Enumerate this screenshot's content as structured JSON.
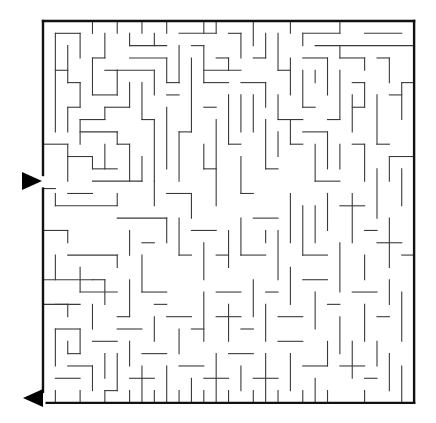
{
  "puzzle": {
    "type": "maze",
    "colors": {
      "wall": "#3a3a3a",
      "border": "#111111",
      "arrow": "#000000",
      "background": "#ffffff"
    },
    "grid": {
      "origin_x": 43,
      "origin_y": 21,
      "cell_w": 12.37,
      "cell_h": 12.32,
      "cols": 30,
      "rows": 31
    },
    "entrance": {
      "side": "left",
      "arrow": "right-pointing",
      "y": 181,
      "gap_rows": [
        12.5,
        13.6
      ]
    },
    "exit": {
      "side": "left-bottom",
      "arrow": "left-pointing",
      "y": 398,
      "gap_rows": [
        30.1,
        31
      ]
    },
    "border": [
      [
        0,
        0,
        30,
        0
      ],
      [
        30,
        0,
        30,
        31
      ],
      [
        30,
        31,
        0.3,
        31
      ],
      [
        0,
        30.1,
        0,
        13.6
      ],
      [
        0,
        12.5,
        0,
        0
      ]
    ],
    "walls": [
      [
        4,
        0,
        4,
        1
      ],
      [
        6,
        0,
        6,
        1
      ],
      [
        8,
        0,
        8,
        1
      ],
      [
        10,
        0,
        10,
        1
      ],
      [
        13,
        0,
        13,
        1
      ],
      [
        17,
        0,
        17,
        2
      ],
      [
        20,
        0,
        20,
        1
      ],
      [
        24,
        0,
        24,
        1
      ],
      [
        1,
        1,
        3,
        1
      ],
      [
        3,
        1,
        3,
        3
      ],
      [
        5,
        1,
        5,
        3
      ],
      [
        5,
        3,
        4,
        3
      ],
      [
        7,
        1,
        7,
        2
      ],
      [
        7,
        2,
        10,
        2
      ],
      [
        9,
        2,
        9,
        1
      ],
      [
        11,
        1,
        14,
        1
      ],
      [
        14,
        1,
        14,
        0
      ],
      [
        15,
        1,
        16,
        1
      ],
      [
        16,
        1,
        16,
        3
      ],
      [
        18,
        1,
        18,
        3
      ],
      [
        19,
        1,
        19,
        4
      ],
      [
        21,
        1,
        24,
        1
      ],
      [
        21,
        1,
        21,
        2
      ],
      [
        22,
        2,
        30,
        2
      ],
      [
        26,
        1,
        29,
        1
      ],
      [
        1,
        1,
        1,
        9
      ],
      [
        2,
        2,
        2,
        5
      ],
      [
        2,
        5,
        3,
        5
      ],
      [
        3,
        5,
        3,
        7
      ],
      [
        3,
        7,
        2,
        7
      ],
      [
        2,
        7,
        2,
        9
      ],
      [
        1,
        4,
        2,
        4
      ],
      [
        4,
        3,
        4,
        6
      ],
      [
        4,
        6,
        6,
        6
      ],
      [
        6,
        6,
        6,
        4
      ],
      [
        6,
        4,
        9,
        4
      ],
      [
        9,
        4,
        9,
        6
      ],
      [
        5,
        4,
        6,
        4
      ],
      [
        7,
        3,
        10,
        3
      ],
      [
        10,
        3,
        10,
        5
      ],
      [
        10,
        5,
        11,
        5
      ],
      [
        8,
        5,
        8,
        8
      ],
      [
        8,
        8,
        9,
        8
      ],
      [
        9,
        8,
        9,
        13
      ],
      [
        7,
        5,
        7,
        7
      ],
      [
        7,
        7,
        5,
        7
      ],
      [
        5,
        7,
        5,
        8
      ],
      [
        5,
        8,
        3,
        8
      ],
      [
        3,
        8,
        3,
        10
      ],
      [
        11,
        2,
        11,
        5
      ],
      [
        12,
        2,
        13,
        2
      ],
      [
        13,
        2,
        13,
        5
      ],
      [
        13,
        5,
        15,
        5
      ],
      [
        12,
        3,
        12,
        9
      ],
      [
        12,
        9,
        11,
        9
      ],
      [
        11,
        9,
        11,
        13
      ],
      [
        14,
        3,
        15,
        3
      ],
      [
        15,
        3,
        15,
        4
      ],
      [
        16,
        4,
        13,
        4
      ],
      [
        17,
        3,
        18,
        3
      ],
      [
        19,
        4,
        20,
        4
      ],
      [
        20,
        3,
        20,
        6
      ],
      [
        21,
        3,
        23,
        3
      ],
      [
        23,
        3,
        23,
        6
      ],
      [
        24,
        3,
        26,
        3
      ],
      [
        24,
        2,
        24,
        3
      ],
      [
        26,
        3,
        26,
        4
      ],
      [
        27,
        3,
        28,
        3
      ],
      [
        28,
        3,
        28,
        5
      ],
      [
        29,
        5,
        30,
        5
      ],
      [
        29,
        5,
        29,
        8
      ],
      [
        16,
        5,
        18,
        5
      ],
      [
        18,
        5,
        18,
        7
      ],
      [
        17,
        6,
        17,
        9
      ],
      [
        21,
        4,
        21,
        7
      ],
      [
        21,
        7,
        22,
        7
      ],
      [
        22,
        5,
        22,
        4
      ],
      [
        24,
        4,
        24,
        8
      ],
      [
        24,
        8,
        23,
        8
      ],
      [
        25,
        5,
        26,
        5
      ],
      [
        26,
        5,
        26,
        7
      ],
      [
        26,
        7,
        25,
        7
      ],
      [
        25,
        6,
        25,
        9
      ],
      [
        27,
        6,
        27,
        10
      ],
      [
        27,
        10,
        28,
        10
      ],
      [
        28,
        6,
        29,
        6
      ],
      [
        0,
        10,
        2,
        10
      ],
      [
        2,
        10,
        2,
        13
      ],
      [
        2,
        11,
        4,
        11
      ],
      [
        4,
        11,
        4,
        12
      ],
      [
        4,
        12,
        6,
        12
      ],
      [
        5,
        10,
        5,
        12
      ],
      [
        6,
        10,
        7,
        10
      ],
      [
        7,
        10,
        7,
        13
      ],
      [
        3,
        9,
        6,
        9
      ],
      [
        6,
        9,
        6,
        10
      ],
      [
        4,
        13,
        8,
        13
      ],
      [
        8,
        11,
        8,
        13
      ],
      [
        0,
        13.6,
        1,
        13.6
      ],
      [
        1,
        14,
        1,
        15
      ],
      [
        1,
        15,
        6,
        15
      ],
      [
        6,
        15,
        6,
        14
      ],
      [
        2,
        14,
        4,
        14
      ],
      [
        9,
        13,
        9,
        15
      ],
      [
        10,
        14,
        12,
        14
      ],
      [
        12,
        14,
        12,
        16
      ],
      [
        13,
        10,
        13,
        12
      ],
      [
        13,
        12,
        14,
        12
      ],
      [
        14,
        8,
        14,
        15
      ],
      [
        15,
        6,
        15,
        10
      ],
      [
        15,
        10,
        16,
        10
      ],
      [
        16,
        11,
        16,
        14
      ],
      [
        16,
        14,
        17,
        14
      ],
      [
        18,
        8,
        18,
        12
      ],
      [
        18,
        12,
        19,
        12
      ],
      [
        19,
        9,
        19,
        11
      ],
      [
        20,
        8,
        20,
        10
      ],
      [
        20,
        10,
        21,
        10
      ],
      [
        21,
        9,
        23,
        9
      ],
      [
        23,
        9,
        23,
        12
      ],
      [
        22,
        10,
        22,
        13
      ],
      [
        22,
        13,
        24,
        13
      ],
      [
        24,
        10,
        24,
        12
      ],
      [
        25,
        10,
        26,
        10
      ],
      [
        26,
        10,
        26,
        13
      ],
      [
        28,
        11,
        30,
        11
      ],
      [
        28,
        11,
        28,
        13
      ],
      [
        29,
        12,
        29,
        15
      ],
      [
        27,
        12,
        27,
        16
      ],
      [
        10,
        6,
        11,
        6
      ],
      [
        10,
        7,
        10,
        12
      ],
      [
        14,
        7,
        13,
        7
      ],
      [
        16,
        6,
        16,
        9
      ],
      [
        19,
        6,
        19,
        8
      ],
      [
        19,
        8,
        21,
        8
      ],
      [
        0,
        17,
        2,
        17
      ],
      [
        2,
        17,
        2,
        18
      ],
      [
        1,
        19,
        1,
        21
      ],
      [
        2,
        19,
        6,
        19
      ],
      [
        6,
        19,
        6,
        20
      ],
      [
        3,
        20,
        3,
        22
      ],
      [
        4,
        21,
        5,
        21
      ],
      [
        5,
        21,
        5,
        23
      ],
      [
        0,
        21,
        4,
        21
      ],
      [
        1,
        23,
        2,
        23
      ],
      [
        2,
        23,
        2,
        24
      ],
      [
        1,
        25,
        1,
        28
      ],
      [
        1,
        25,
        3,
        25
      ],
      [
        3,
        25,
        3,
        27
      ],
      [
        3,
        27,
        2,
        27
      ],
      [
        2,
        26,
        2,
        27
      ],
      [
        3,
        22,
        6,
        22
      ],
      [
        4,
        23,
        4,
        25
      ],
      [
        6,
        24,
        7,
        24
      ],
      [
        7,
        21,
        7,
        24
      ],
      [
        8,
        19,
        8,
        22
      ],
      [
        8,
        22,
        10,
        22
      ],
      [
        9,
        23,
        10,
        23
      ],
      [
        6,
        16,
        10,
        16
      ],
      [
        10,
        16,
        10,
        18
      ],
      [
        7,
        17,
        7,
        19
      ],
      [
        8,
        18,
        9,
        18
      ],
      [
        11,
        16,
        11,
        19
      ],
      [
        11,
        19,
        12,
        19
      ],
      [
        12,
        17,
        14,
        17
      ],
      [
        13,
        18,
        13,
        21
      ],
      [
        14,
        19,
        15,
        19
      ],
      [
        15,
        17,
        15,
        20
      ],
      [
        16,
        16,
        16,
        19
      ],
      [
        16,
        19,
        18,
        19
      ],
      [
        17,
        16,
        19,
        16
      ],
      [
        18,
        17,
        18,
        18
      ],
      [
        19,
        17,
        19,
        21
      ],
      [
        20,
        14,
        20,
        18
      ],
      [
        21,
        15,
        21,
        19
      ],
      [
        21,
        19,
        23,
        19
      ],
      [
        22,
        15,
        22,
        18
      ],
      [
        23,
        14,
        23,
        17
      ],
      [
        24,
        15,
        26,
        15
      ],
      [
        25,
        14,
        25,
        18
      ],
      [
        26,
        17,
        27,
        17
      ],
      [
        27,
        18,
        29,
        18
      ],
      [
        28,
        16,
        28,
        20
      ],
      [
        29,
        19,
        30,
        19
      ],
      [
        26,
        19,
        26,
        21
      ],
      [
        24,
        18,
        24,
        22
      ],
      [
        0,
        23,
        3,
        23
      ],
      [
        4,
        26,
        6,
        26
      ],
      [
        5,
        27,
        5,
        29
      ],
      [
        6,
        25,
        8,
        25
      ],
      [
        7,
        26,
        7,
        28
      ],
      [
        8,
        27,
        10,
        27
      ],
      [
        9,
        24,
        9,
        26
      ],
      [
        10,
        24,
        12,
        24
      ],
      [
        11,
        25,
        11,
        27
      ],
      [
        12,
        25,
        13,
        25
      ],
      [
        13,
        22,
        13,
        26
      ],
      [
        14,
        22,
        16,
        22
      ],
      [
        15,
        23,
        15,
        26
      ],
      [
        14,
        24,
        16,
        24
      ],
      [
        16,
        25,
        17,
        25
      ],
      [
        17,
        21,
        17,
        24
      ],
      [
        18,
        22,
        19,
        22
      ],
      [
        18,
        23,
        18,
        26
      ],
      [
        19,
        24,
        21,
        24
      ],
      [
        20,
        20,
        20,
        23
      ],
      [
        21,
        21,
        23,
        21
      ],
      [
        22,
        22,
        22,
        25
      ],
      [
        23,
        23,
        24,
        23
      ],
      [
        24,
        24,
        24,
        27
      ],
      [
        25,
        22,
        27,
        22
      ],
      [
        26,
        23,
        26,
        26
      ],
      [
        27,
        24,
        28,
        24
      ],
      [
        28,
        21,
        28,
        23
      ],
      [
        29,
        22,
        29,
        26
      ],
      [
        1,
        29,
        3,
        29
      ],
      [
        2,
        28,
        4,
        28
      ],
      [
        4,
        28,
        4,
        30
      ],
      [
        5,
        30,
        6,
        30
      ],
      [
        6,
        27,
        6,
        30
      ],
      [
        7,
        29,
        9,
        29
      ],
      [
        8,
        28,
        8,
        31
      ],
      [
        10,
        28,
        10,
        31
      ],
      [
        11,
        28,
        13,
        28
      ],
      [
        12,
        29,
        12,
        31
      ],
      [
        13,
        29,
        15,
        29
      ],
      [
        14,
        27,
        14,
        31
      ],
      [
        15,
        27,
        17,
        27
      ],
      [
        16,
        28,
        16,
        30
      ],
      [
        17,
        29,
        19,
        29
      ],
      [
        18,
        27,
        18,
        31
      ],
      [
        19,
        26,
        21,
        26
      ],
      [
        20,
        27,
        20,
        30
      ],
      [
        21,
        28,
        23,
        28
      ],
      [
        22,
        29,
        22,
        31
      ],
      [
        23,
        26,
        23,
        28
      ],
      [
        24,
        28,
        26,
        28
      ],
      [
        25,
        26,
        25,
        29
      ],
      [
        26,
        29,
        27,
        29
      ],
      [
        27,
        26,
        27,
        28
      ],
      [
        28,
        27,
        28,
        30
      ],
      [
        29,
        28,
        29,
        31
      ],
      [
        1,
        30,
        1,
        31
      ],
      [
        3,
        30,
        3,
        31
      ],
      [
        5,
        31,
        5,
        30
      ],
      [
        7,
        30,
        7,
        31
      ],
      [
        9,
        30,
        9,
        31
      ],
      [
        11,
        30,
        11,
        31
      ],
      [
        13,
        30,
        13,
        31
      ],
      [
        15,
        30,
        15,
        31
      ],
      [
        17,
        30,
        17,
        31
      ],
      [
        19,
        30,
        19,
        31
      ],
      [
        21,
        30,
        21,
        31
      ],
      [
        23,
        30,
        23,
        31
      ],
      [
        26,
        30,
        26,
        31
      ]
    ]
  }
}
